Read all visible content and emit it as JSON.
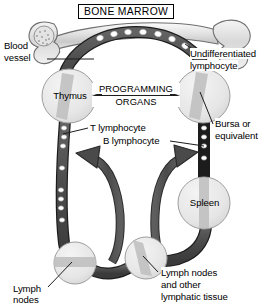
{
  "figure": {
    "title": "BONE MARROW",
    "background_color": "#ffffff",
    "vessel_color": "#4d4d4d",
    "vessel_outline_color": "#1a1a1a",
    "organ_fill_color": "#e8e8e8",
    "organ_stripe_color": "#b3b3b3",
    "bone_fill_color": "#e0e0e0",
    "cell_color": "#ffffff",
    "text_color": "#000000"
  },
  "labels": {
    "bone_marrow": "BONE MARROW",
    "blood_vessel_line1": "Blood",
    "blood_vessel_line2": "vessel",
    "undifferentiated_line1": "Undifferentiated",
    "undifferentiated_line2": "lymphocyte",
    "thymus": "Thymus",
    "programming_line1": "PROGRAMMING",
    "programming_line2": "ORGANS",
    "bursa_line1": "Bursa or",
    "bursa_line2": "equivalent",
    "t_lymphocyte": "T lymphocyte",
    "b_lymphocyte": "B lymphocyte",
    "spleen": "Spleen",
    "lymph_nodes_line1": "Lymph",
    "lymph_nodes_line2": "nodes",
    "lymph_other_line1": "Lymph nodes",
    "lymph_other_line2": "and other",
    "lymph_other_line3": "lymphatic tissue"
  },
  "organs": [
    {
      "name": "thymus",
      "label": "Thymus",
      "cx": 69,
      "cy": 96,
      "r": 27,
      "stripe": "diagonal"
    },
    {
      "name": "bursa",
      "label": "",
      "cx": 203,
      "cy": 96,
      "r": 27,
      "stripe": "diagonal"
    },
    {
      "name": "spleen",
      "label": "Spleen",
      "cx": 204,
      "cy": 203,
      "r": 26,
      "stripe": "vertical"
    },
    {
      "name": "lymph-node-left",
      "label": "",
      "cx": 75,
      "cy": 263,
      "r": 21,
      "stripe": "horizontal"
    },
    {
      "name": "lymph-node-right",
      "label": "",
      "cx": 146,
      "cy": 258,
      "r": 21,
      "stripe": "diagonal"
    }
  ],
  "arrows": {
    "programming_arrow": "double-headed",
    "left_flow_arrow": "points-left",
    "right_flow_arrow": "points-right"
  },
  "vessel_cells": {
    "top_arc_count": 7,
    "left_vessel_count": 8,
    "right_vessel_count": 4
  }
}
